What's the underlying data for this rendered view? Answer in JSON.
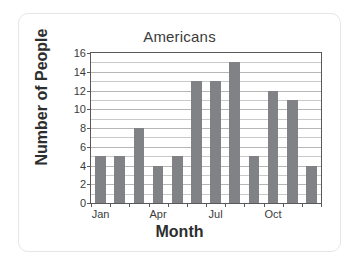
{
  "chart_data": {
    "type": "bar",
    "title": "Americans",
    "xlabel": "Month",
    "ylabel": "Number of People",
    "categories": [
      "Jan",
      "Feb",
      "Mar",
      "Apr",
      "May",
      "Jun",
      "Jul",
      "Aug",
      "Sep",
      "Oct",
      "Nov",
      "Dec"
    ],
    "values": [
      5,
      5,
      8,
      4,
      5,
      13,
      13,
      15,
      5,
      12,
      11,
      4
    ],
    "xtick_labels": [
      "Jan",
      "Apr",
      "Jul",
      "Oct"
    ],
    "xtick_categories": [
      "Jan",
      "Apr",
      "Jul",
      "Oct"
    ],
    "ytick_labels": [
      "0",
      "2",
      "4",
      "6",
      "8",
      "10",
      "12",
      "14",
      "16"
    ],
    "yticks": [
      0,
      2,
      4,
      6,
      8,
      10,
      12,
      14,
      16
    ],
    "ylim": [
      0,
      16
    ],
    "grid": true,
    "grid_axis": "y",
    "grid_step": 1,
    "legend": false,
    "bar_color": "#808285",
    "axis_color": "#58595b",
    "grid_color": "#c9c9c9",
    "background_color": "#ffffff"
  }
}
